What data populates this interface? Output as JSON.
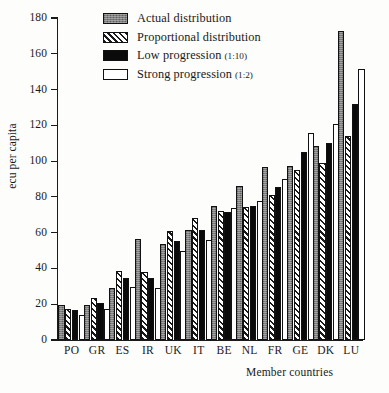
{
  "chart_data": {
    "type": "bar",
    "title": "",
    "xlabel": "Member countries",
    "ylabel": "ecu per capita",
    "ylim": [
      0,
      180
    ],
    "yticks": [
      0,
      20,
      40,
      60,
      80,
      100,
      120,
      140,
      160,
      180
    ],
    "grid": false,
    "legend_position": "top-center",
    "categories": [
      "PO",
      "GR",
      "ES",
      "IR",
      "UK",
      "IT",
      "BE",
      "NL",
      "FR",
      "GE",
      "DK",
      "LU"
    ],
    "series": [
      {
        "name": "Actual distribution",
        "fill": "grey-stipple",
        "color": "#7d7d7d",
        "values": [
          19.5,
          19.5,
          29,
          56.5,
          53.5,
          61.5,
          75,
          86,
          96.5,
          97,
          108.5,
          173
        ]
      },
      {
        "name": "Proportional distribution",
        "fill": "diagonal-hatch",
        "color": "#ffffff",
        "values": [
          17.5,
          23.5,
          38.5,
          38,
          61,
          68,
          72,
          74.5,
          81,
          95,
          99,
          114
        ]
      },
      {
        "name": "Low progression (1:10)",
        "fill": "solid-black",
        "color": "#0a0a0a",
        "values": [
          16.5,
          20.5,
          34.5,
          34.5,
          55.5,
          61.5,
          71.5,
          75,
          85.5,
          105,
          110,
          132
        ]
      },
      {
        "name": "Strong progression (1:2)",
        "fill": "white",
        "color": "#ffffff",
        "values": [
          14,
          17.5,
          29.5,
          29,
          50,
          56,
          74,
          77.5,
          90,
          115.5,
          120.5,
          151.5
        ]
      }
    ]
  },
  "legend": {
    "items": [
      {
        "label": "Actual distribution",
        "sub": ""
      },
      {
        "label": "Proportional distribution",
        "sub": ""
      },
      {
        "label": "Low progression",
        "sub": "(1:10)"
      },
      {
        "label": "Strong progression",
        "sub": "(1:2)"
      }
    ]
  }
}
